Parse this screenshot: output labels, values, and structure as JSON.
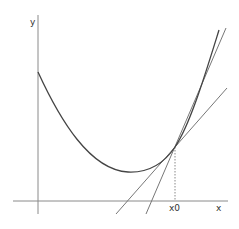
{
  "diagram": {
    "axes": {
      "x_label": "x",
      "y_label": "y",
      "point_label": "x0"
    },
    "elements": [
      {
        "name": "convex-curve",
        "description": "convex function curve with minimum between y-axis and x0"
      },
      {
        "name": "tangent-line",
        "description": "tangent line to curve at x0"
      },
      {
        "name": "steeper-line",
        "description": "steeper line through point at x0"
      },
      {
        "name": "x0-guide",
        "description": "dotted vertical line from curve point at x0 down to x-axis"
      }
    ],
    "colors": {
      "axis": "#888888",
      "curve": "#444444",
      "lines": "#666666",
      "background": "#ffffff"
    }
  }
}
